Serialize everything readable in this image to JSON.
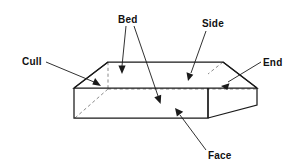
{
  "figure": {
    "type": "technical-line-diagram",
    "background_color": "#ffffff",
    "line_color": "#1a1a1a",
    "hidden_line_color": "#8a8a8a",
    "text_color": "#111111"
  },
  "labels": {
    "bed": "Bed",
    "side": "Side",
    "end": "End",
    "face": "Face",
    "cull": "Cull"
  },
  "callouts": [
    {
      "key": "bed",
      "text": "Bed",
      "text_x": 118,
      "text_y": 23,
      "leaders": 2,
      "points_to": [
        "top-surface",
        "interior-bottom-surface"
      ]
    },
    {
      "key": "side",
      "text": "Side",
      "text_x": 202,
      "text_y": 27,
      "leaders": 1,
      "points_to": [
        "top-right-surface"
      ]
    },
    {
      "key": "end",
      "text": "End",
      "text_x": 263,
      "text_y": 66,
      "leaders": 1,
      "points_to": [
        "right-end-surface"
      ]
    },
    {
      "key": "face",
      "text": "Face",
      "text_x": 208,
      "text_y": 159,
      "leaders": 1,
      "points_to": [
        "front-face-surface"
      ]
    },
    {
      "key": "cull",
      "text": "Cull",
      "text_x": 22,
      "text_y": 65,
      "leaders": 1,
      "points_to": [
        "left-bevel-surface"
      ]
    }
  ],
  "geometry": {
    "top_face": [
      [
        108,
        62
      ],
      [
        223,
        62
      ],
      [
        257,
        88
      ],
      [
        74,
        88
      ]
    ],
    "front_face": [
      [
        74,
        88
      ],
      [
        208,
        88
      ],
      [
        208,
        118
      ],
      [
        74,
        118
      ]
    ],
    "right_end_face": [
      [
        208,
        88
      ],
      [
        257,
        88
      ],
      [
        257,
        105
      ],
      [
        208,
        118
      ]
    ],
    "hidden_back_bottom": [
      [
        108,
        88
      ],
      [
        257,
        88
      ]
    ],
    "hidden_left_vertical": [
      [
        108,
        62
      ],
      [
        108,
        88
      ]
    ],
    "hidden_left_diagonal": [
      [
        74,
        118
      ],
      [
        108,
        88
      ]
    ]
  }
}
